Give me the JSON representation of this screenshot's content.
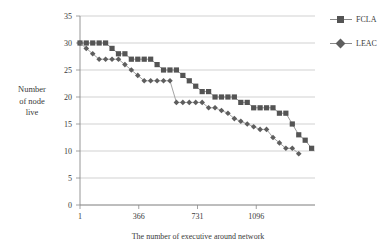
{
  "chart_data": {
    "type": "line",
    "title": "",
    "xlabel": "The number of executive around network",
    "ylabel": "Number of node live",
    "ylabel_lines": [
      "Number",
      "of node",
      "live"
    ],
    "xlim": [
      1,
      1461
    ],
    "ylim": [
      0,
      35
    ],
    "yticks": [
      0,
      5,
      10,
      15,
      20,
      25,
      30,
      35
    ],
    "ytick_labels": [
      "0",
      "5",
      "10",
      "15",
      "20",
      "25",
      "30",
      "35"
    ],
    "xticks": [
      1,
      366,
      731,
      1096
    ],
    "xtick_labels": [
      "1",
      "366",
      "731",
      "1096"
    ],
    "grid": "horizontal",
    "legend_position": "top-right-outside",
    "series": [
      {
        "name": "FCLA",
        "marker": "square",
        "color": "#545454",
        "line_color": "#8a8a8a",
        "x": [
          1,
          40,
          80,
          120,
          160,
          200,
          240,
          280,
          320,
          360,
          400,
          440,
          480,
          520,
          560,
          600,
          640,
          680,
          720,
          760,
          800,
          840,
          880,
          920,
          960,
          1000,
          1040,
          1080,
          1120,
          1160,
          1200,
          1240,
          1280,
          1320,
          1360,
          1400,
          1440
        ],
        "values": [
          30,
          30,
          30,
          30,
          30,
          29,
          28,
          28,
          27,
          27,
          27,
          27,
          26,
          25,
          25,
          25,
          24,
          23,
          22,
          21,
          21,
          20,
          20,
          20,
          20,
          19,
          19,
          18,
          18,
          18,
          18,
          17,
          17,
          15,
          13,
          12,
          10.5
        ]
      },
      {
        "name": "LEAC",
        "marker": "diamond",
        "color": "#5e5e5e",
        "line_color": "#9a9a9a",
        "x": [
          1,
          40,
          80,
          120,
          160,
          200,
          240,
          280,
          320,
          360,
          400,
          440,
          480,
          520,
          560,
          600,
          640,
          680,
          720,
          760,
          800,
          840,
          880,
          920,
          960,
          1000,
          1040,
          1080,
          1120,
          1160,
          1200,
          1240,
          1280,
          1320,
          1360
        ],
        "values": [
          30,
          29,
          28,
          27,
          27,
          27,
          27,
          26,
          25,
          24,
          23,
          23,
          23,
          23,
          23,
          19,
          19,
          19,
          19,
          19,
          18,
          18,
          17.5,
          17,
          16,
          15.5,
          15,
          14.5,
          14,
          14,
          12.5,
          11.5,
          10.5,
          10.5,
          9.5
        ]
      }
    ]
  },
  "legend": {
    "entries": [
      {
        "label": "FCLA",
        "marker": "square-marker"
      },
      {
        "label": "LEAC",
        "marker": "diamond-marker"
      }
    ]
  }
}
